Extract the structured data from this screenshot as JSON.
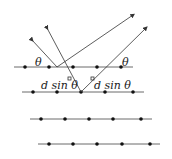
{
  "labels": {
    "theta_left": "θ",
    "theta_right": "θ",
    "path_left": "d sin θ",
    "path_right": "d sin θ"
  },
  "colors": {
    "line": "#333333",
    "dot": "#111111"
  }
}
